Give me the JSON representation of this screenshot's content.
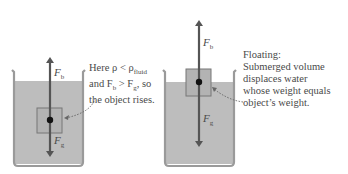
{
  "colors": {
    "water": "#bdbdbd",
    "beaker": "#9a9a9a",
    "arrow": "#555555",
    "box_fill": "#b3b3b3",
    "text": "#4a4a4a"
  },
  "panels": [
    {
      "id": "rising",
      "force_up": {
        "symbol": "F",
        "sub": "b"
      },
      "force_down": {
        "symbol": "F",
        "sub": "g"
      },
      "caption_lines": [
        "Here ρ < ρ",
        "and F",
        "the object rises."
      ],
      "caption_line1_sub": "fluid",
      "caption_line2_b": "b",
      "caption_line2_mid": " > F",
      "caption_line2_g": "g",
      "caption_line2_end": ", so"
    },
    {
      "id": "floating",
      "force_up": {
        "symbol": "F",
        "sub": "b"
      },
      "force_down": {
        "symbol": "F",
        "sub": "g"
      },
      "caption_lines": [
        "Floating:",
        "Submerged volume",
        "displaces water",
        "whose weight equals",
        "object’s weight."
      ]
    }
  ]
}
